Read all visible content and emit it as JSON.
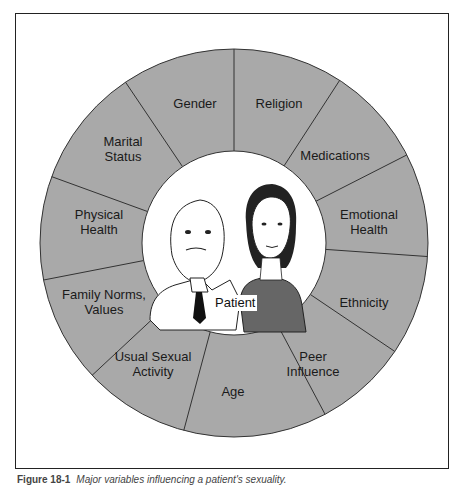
{
  "diagram": {
    "center_label": "Patient",
    "colors": {
      "segment_fill": "#a9a9a9",
      "segment_stroke": "#333333",
      "center_fill": "#ffffff",
      "text": "#1a1a1a"
    },
    "segments": [
      {
        "label": "Gender",
        "x": 195,
        "y": 103
      },
      {
        "label": "Religion",
        "x": 279,
        "y": 103
      },
      {
        "label": "Medications",
        "x": 335,
        "y": 155
      },
      {
        "label": "Emotional\nHealth",
        "x": 369,
        "y": 222
      },
      {
        "label": "Ethnicity",
        "x": 364,
        "y": 302
      },
      {
        "label": "Peer\nInfluence",
        "x": 313,
        "y": 364
      },
      {
        "label": "Age",
        "x": 233,
        "y": 391
      },
      {
        "label": "Usual Sexual\nActivity",
        "x": 153,
        "y": 364
      },
      {
        "label": "Family Norms,\nValues",
        "x": 104,
        "y": 302
      },
      {
        "label": "Physical\nHealth",
        "x": 99,
        "y": 222
      },
      {
        "label": "Marital\nStatus",
        "x": 123,
        "y": 149
      }
    ]
  },
  "caption": {
    "figure_number": "Figure 18-1",
    "text": "Major variables influencing a patient's sexuality."
  }
}
